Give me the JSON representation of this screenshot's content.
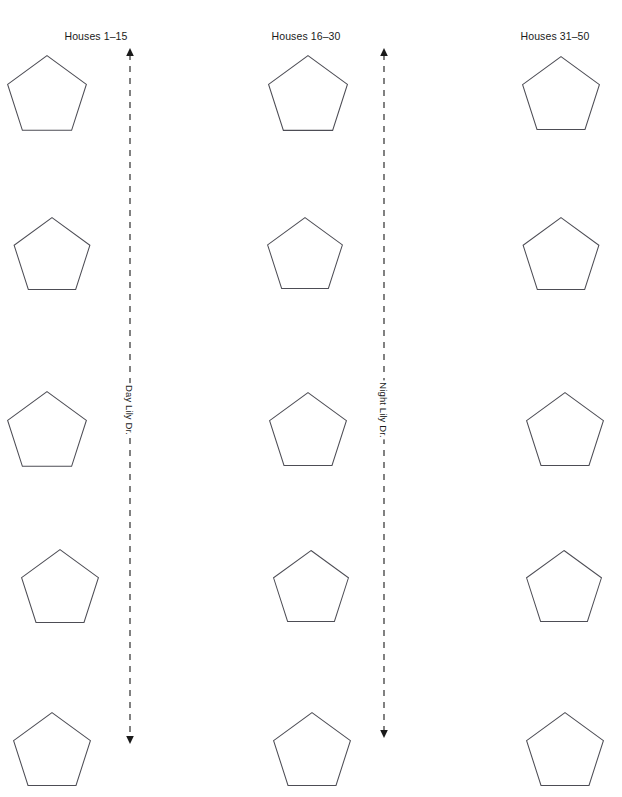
{
  "map": {
    "width": 622,
    "height": 797,
    "background_color": "#ffffff",
    "outline_color": "#4d4d55",
    "label_color": "#1a1a1a"
  },
  "columns": [
    {
      "id": "col-left",
      "label": "Houses 1–15",
      "label_x": 96,
      "label_y": 30,
      "shape_x": 6,
      "shape_width": 82
    },
    {
      "id": "col-middle",
      "label": "Houses 16–30",
      "label_x": 305,
      "label_y": 30,
      "shape_x": 266,
      "shape_width": 84
    },
    {
      "id": "col-right",
      "label": "Houses 31–50",
      "label_x": 555,
      "label_y": 30,
      "shape_x": 521,
      "shape_width": 80
    }
  ],
  "rows": [
    {
      "id": "row-1",
      "y": 54,
      "height": 78
    },
    {
      "id": "row-2",
      "y": 216,
      "height": 78
    },
    {
      "id": "row-3",
      "y": 390,
      "height": 78
    },
    {
      "id": "row-4",
      "y": 548,
      "height": 78
    },
    {
      "id": "row-5",
      "y": 710,
      "height": 78
    }
  ],
  "houses": [
    {
      "id": "house-c1-r1",
      "column": "col-left",
      "row": "row-1",
      "x": 6,
      "y": 54,
      "w": 82,
      "h": 78
    },
    {
      "id": "house-c1-r2",
      "column": "col-left",
      "row": "row-2",
      "x": 12,
      "y": 216,
      "w": 80,
      "h": 75
    },
    {
      "id": "house-c1-r3",
      "column": "col-left",
      "row": "row-3",
      "x": 6,
      "y": 390,
      "w": 82,
      "h": 78
    },
    {
      "id": "house-c1-r4",
      "column": "col-left",
      "row": "row-4",
      "x": 20,
      "y": 548,
      "w": 80,
      "h": 76
    },
    {
      "id": "house-c1-r5",
      "column": "col-left",
      "row": "row-5",
      "x": 12,
      "y": 710,
      "w": 80,
      "h": 78
    },
    {
      "id": "house-c2-r1",
      "column": "col-middle",
      "row": "row-1",
      "x": 266,
      "y": 54,
      "w": 84,
      "h": 78
    },
    {
      "id": "house-c2-r2",
      "column": "col-middle",
      "row": "row-2",
      "x": 266,
      "y": 216,
      "w": 78,
      "h": 74
    },
    {
      "id": "house-c2-r3",
      "column": "col-middle",
      "row": "row-3",
      "x": 268,
      "y": 390,
      "w": 80,
      "h": 78
    },
    {
      "id": "house-c2-r4",
      "column": "col-middle",
      "row": "row-4",
      "x": 272,
      "y": 548,
      "w": 78,
      "h": 76
    },
    {
      "id": "house-c2-r5",
      "column": "col-middle",
      "row": "row-5",
      "x": 272,
      "y": 710,
      "w": 80,
      "h": 78
    },
    {
      "id": "house-c3-r1",
      "column": "col-right",
      "row": "row-1",
      "x": 521,
      "y": 54,
      "w": 80,
      "h": 78
    },
    {
      "id": "house-c3-r2",
      "column": "col-right",
      "row": "row-2",
      "x": 521,
      "y": 216,
      "w": 80,
      "h": 75
    },
    {
      "id": "house-c3-r3",
      "column": "col-right",
      "row": "row-3",
      "x": 525,
      "y": 390,
      "w": 80,
      "h": 78
    },
    {
      "id": "house-c3-r4",
      "column": "col-right",
      "row": "row-4",
      "x": 525,
      "y": 548,
      "w": 78,
      "h": 76
    },
    {
      "id": "house-c3-r5",
      "column": "col-right",
      "row": "row-5",
      "x": 525,
      "y": 710,
      "w": 80,
      "h": 78
    }
  ],
  "streets": [
    {
      "id": "street-day-lily",
      "name": "Day Lily Dr.",
      "x": 129,
      "y_top": 48,
      "y_bottom": 742,
      "label_y": 410,
      "arrow_top": true,
      "arrow_bottom": true,
      "dash": "6 6"
    },
    {
      "id": "street-night-lily",
      "name": "Night Lily Dr.",
      "x": 383,
      "y_top": 48,
      "y_bottom": 736,
      "label_y": 410,
      "arrow_top": true,
      "arrow_bottom": true,
      "dash": "6 6"
    }
  ]
}
